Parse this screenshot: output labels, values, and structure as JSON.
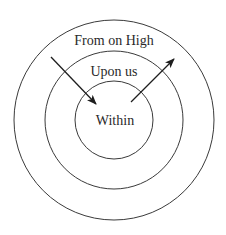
{
  "diagram": {
    "type": "concentric-circles",
    "colors": {
      "stroke": "#3a3a3a",
      "text": "#2a2a2a",
      "background": "#ffffff"
    },
    "rings": [
      {
        "id": "outer",
        "label": "From on High"
      },
      {
        "id": "middle",
        "label": "Upon us"
      },
      {
        "id": "inner",
        "label": "Within"
      }
    ],
    "arrows": [
      {
        "id": "inward",
        "direction": "from outer ring into inner circle"
      },
      {
        "id": "outward",
        "direction": "from inner circle out to outer ring"
      }
    ]
  }
}
